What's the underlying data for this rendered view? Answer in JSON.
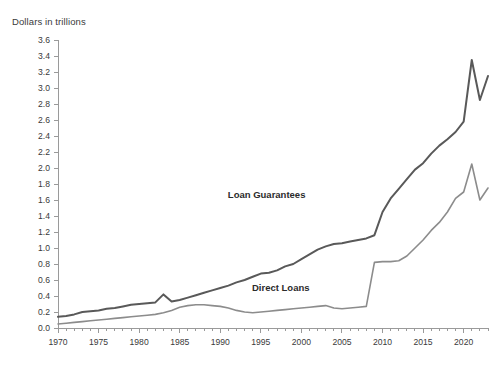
{
  "chart_data": {
    "type": "line",
    "title": "",
    "subtitle": "",
    "ylabel": "Dollars in trillions",
    "xlabel": "",
    "ylim": [
      0.0,
      3.6
    ],
    "xlim": [
      1970,
      2023
    ],
    "ytick_step": 0.2,
    "xtick_step": 1,
    "xlabel_step": 5,
    "grid": false,
    "legend_position": "inline-annotation",
    "ytick_labels": [
      "0.0",
      "0.2",
      "0.4",
      "0.6",
      "0.8",
      "1.0",
      "1.2",
      "1.4",
      "1.6",
      "1.8",
      "2.0",
      "2.2",
      "2.4",
      "2.6",
      "2.8",
      "3.0",
      "3.2",
      "3.4",
      "3.6"
    ],
    "xtick_labels": [
      "1970",
      "1975",
      "1980",
      "1985",
      "1990",
      "1995",
      "2000",
      "2005",
      "2010",
      "2015",
      "2020"
    ],
    "x": [
      1970,
      1971,
      1972,
      1973,
      1974,
      1975,
      1976,
      1977,
      1978,
      1979,
      1980,
      1981,
      1982,
      1983,
      1984,
      1985,
      1986,
      1987,
      1988,
      1989,
      1990,
      1991,
      1992,
      1993,
      1994,
      1995,
      1996,
      1997,
      1998,
      1999,
      2000,
      2001,
      2002,
      2003,
      2004,
      2005,
      2006,
      2007,
      2008,
      2009,
      2010,
      2011,
      2012,
      2013,
      2014,
      2015,
      2016,
      2017,
      2018,
      2019,
      2020,
      2021,
      2022,
      2023
    ],
    "series": [
      {
        "name": "Loan Guarantees",
        "color": "#595959",
        "label_x": 2000.5,
        "label_y": 1.62,
        "values": [
          0.14,
          0.15,
          0.17,
          0.2,
          0.21,
          0.22,
          0.24,
          0.25,
          0.27,
          0.29,
          0.3,
          0.31,
          0.32,
          0.42,
          0.33,
          0.35,
          0.38,
          0.41,
          0.44,
          0.47,
          0.5,
          0.53,
          0.57,
          0.6,
          0.64,
          0.68,
          0.69,
          0.72,
          0.77,
          0.8,
          0.86,
          0.92,
          0.98,
          1.02,
          1.05,
          1.06,
          1.08,
          1.1,
          1.12,
          1.16,
          1.45,
          1.62,
          1.74,
          1.86,
          1.98,
          2.06,
          2.18,
          2.28,
          2.36,
          2.45,
          2.58,
          3.35,
          2.85,
          3.15
        ]
      },
      {
        "name": "Direct Loans",
        "color": "#8c8c8c",
        "label_x": 2001.0,
        "label_y": 0.46,
        "values": [
          0.05,
          0.06,
          0.07,
          0.08,
          0.09,
          0.1,
          0.11,
          0.12,
          0.13,
          0.14,
          0.15,
          0.16,
          0.17,
          0.19,
          0.22,
          0.26,
          0.28,
          0.29,
          0.29,
          0.28,
          0.27,
          0.25,
          0.22,
          0.2,
          0.19,
          0.2,
          0.21,
          0.22,
          0.23,
          0.24,
          0.25,
          0.26,
          0.27,
          0.28,
          0.25,
          0.24,
          0.25,
          0.26,
          0.27,
          0.82,
          0.83,
          0.83,
          0.84,
          0.9,
          1.0,
          1.1,
          1.22,
          1.32,
          1.45,
          1.62,
          1.7,
          2.05,
          1.6,
          1.75
        ]
      }
    ]
  }
}
